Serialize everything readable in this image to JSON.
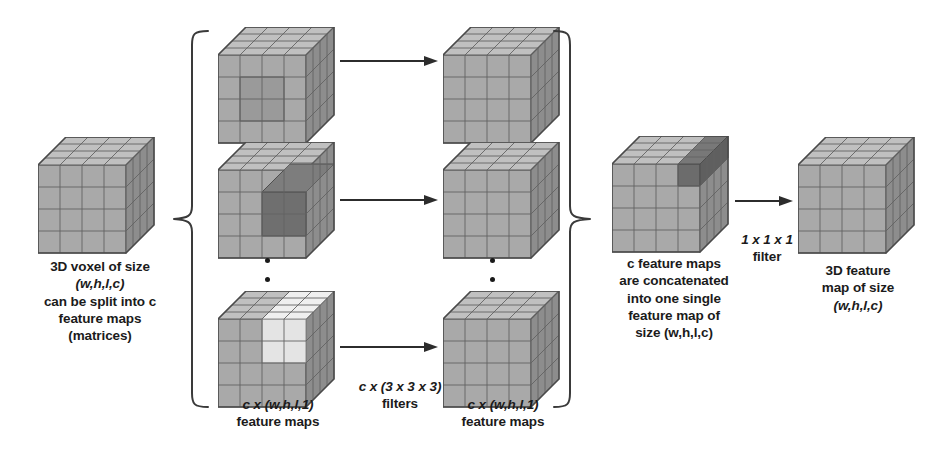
{
  "figure": {
    "title": "3D voxel split into c feature maps, 3x3x3 convolutions, concatenation, and 1x1x1 filter",
    "background_color": "#ffffff",
    "ink_color": "#1b1b1b",
    "cube_face_color": "#a8a8a8",
    "cube_top_color": "#bdbdbd",
    "cube_side_color": "#8f8f8f",
    "highlight_dark_color": "#6f6f6f",
    "highlight_light_color": "#e2e2e2",
    "grid_line_color": "#6a6a6a"
  },
  "captions": {
    "input_voxel": {
      "lines": [
        "3D voxel of size",
        "(w,h,l,c)",
        "can be split into c",
        "feature maps",
        "(matrices)"
      ]
    },
    "left_feature_maps": {
      "lines": [
        "c x (w,h,l,1)",
        "feature maps"
      ]
    },
    "filters": {
      "lines": [
        "c x (3 x 3 x 3)",
        "filters"
      ]
    },
    "right_feature_maps": {
      "lines": [
        "c x (w,h,l,1)",
        "feature maps"
      ]
    },
    "concatenation": {
      "lines": [
        "c feature maps",
        "are concatenated",
        "into one single",
        "feature map of",
        "size (w,h,l,c)"
      ]
    },
    "pointwise_filter": {
      "lines": [
        "1 x 1 x 1",
        "filter"
      ]
    },
    "output_feature_map": {
      "lines": [
        "3D feature",
        "map of size",
        "(w,h,l,c)"
      ]
    }
  },
  "cubes": {
    "input_voxel": {
      "name": "3D voxel",
      "highlight": "none"
    },
    "channel_1": {
      "name": "feature map 1",
      "highlight": "mid-gray block"
    },
    "channel_2": {
      "name": "feature map 2",
      "highlight": "dark block"
    },
    "channel_c": {
      "name": "feature map c",
      "highlight": "light block"
    },
    "conv_out_1": {
      "name": "convolved feature map 1",
      "highlight": "none"
    },
    "conv_out_2": {
      "name": "convolved feature map 2",
      "highlight": "none"
    },
    "conv_out_c": {
      "name": "convolved feature map c",
      "highlight": "none"
    },
    "concatenated": {
      "name": "concatenated feature map",
      "highlight": "dark single voxel"
    },
    "output": {
      "name": "3D output feature map",
      "highlight": "none"
    }
  },
  "icons": {
    "arrow": "arrow-right-icon",
    "left_brace": "left-curly-brace-icon",
    "right_brace": "right-curly-brace-icon",
    "vertical_ellipsis": "vertical-ellipsis-icon"
  }
}
